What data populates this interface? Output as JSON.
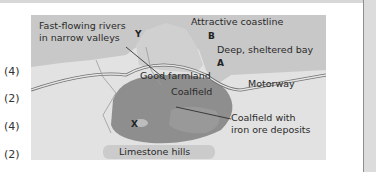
{
  "marks": [
    "(4)",
    "(2)",
    "(4)",
    "(2)"
  ],
  "map": {
    "labels": {
      "rivers_line1": "Fast-flowing rivers",
      "rivers_line2": "in narrow valleys",
      "coastline": "Attractive coastline",
      "bay": "Deep, sheltered bay",
      "farmland": "Good farmland",
      "coalfield": "Coalfield",
      "motorway": "Motorway",
      "coal_iron_line1": "Coalfield with",
      "coal_iron_line2": "iron ore deposits",
      "limestone": "Limestone hills"
    },
    "points": {
      "Y": "Y",
      "B": "B",
      "A": "A",
      "X": "X"
    },
    "colors": {
      "sea": "#c9c9c9",
      "land": "#e4e4e4",
      "coast": "#d2d2d2",
      "coalfield": "#8f8f8f",
      "limestone": "#cdcdcd"
    }
  }
}
